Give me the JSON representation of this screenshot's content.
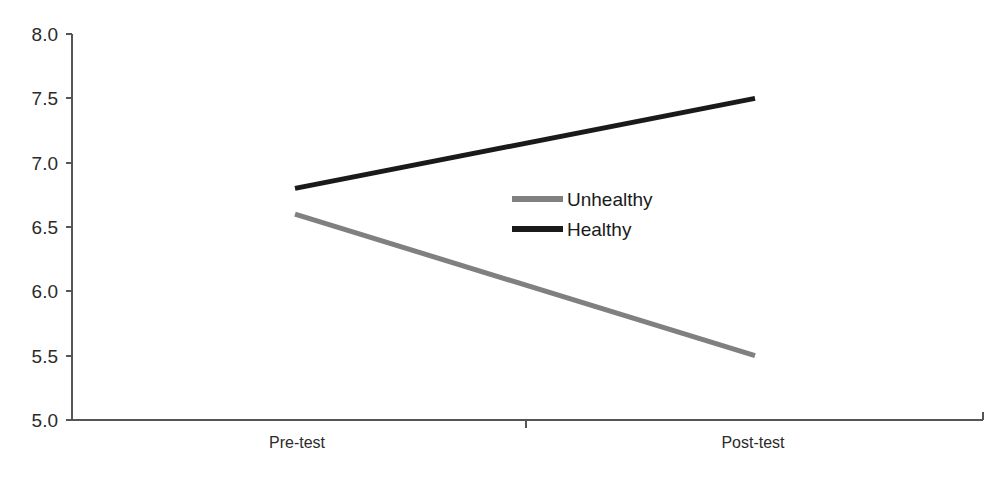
{
  "chart_data": {
    "type": "line",
    "title": "",
    "subtitle": "",
    "xlabel": "",
    "ylabel": "",
    "categories": [
      "Pre-test",
      "Post-test"
    ],
    "series": [
      {
        "name": "Unhealthy",
        "values": [
          6.6,
          5.5
        ],
        "color": "#808080"
      },
      {
        "name": "Healthy",
        "values": [
          6.8,
          7.5
        ],
        "color": "#1a1a1a"
      }
    ],
    "ylim": [
      5.0,
      8.0
    ],
    "ytick_labels": [
      "8.0",
      "7.5",
      "7.0",
      "6.5",
      "6.0",
      "5.5",
      "5.0"
    ],
    "ytick_values": [
      8.0,
      7.5,
      7.0,
      6.5,
      6.0,
      5.5,
      5.0
    ],
    "grid": false,
    "legend_position": "center-right-inside",
    "legend_entries": [
      "Unhealthy",
      "Healthy"
    ]
  },
  "axes": {
    "y_ticks": {
      "t0": "8.0",
      "t1": "7.5",
      "t2": "7.0",
      "t3": "6.5",
      "t4": "6.0",
      "t5": "5.5",
      "t6": "5.0"
    },
    "x_categories": {
      "c0": "Pre-test",
      "c1": "Post-test"
    }
  },
  "legend": {
    "items": {
      "i0": "Unhealthy",
      "i1": "Healthy"
    }
  },
  "colors": {
    "unhealthy": "#808080",
    "healthy": "#1a1a1a",
    "axis": "#555555",
    "background": "#ffffff"
  }
}
